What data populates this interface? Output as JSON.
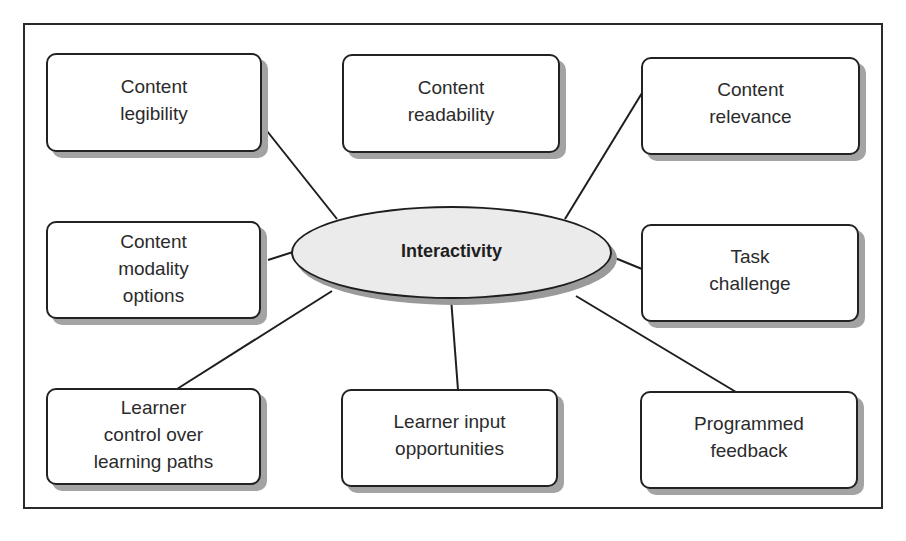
{
  "diagram": {
    "type": "hub-and-spoke concept map",
    "center": {
      "id": "interactivity",
      "label": "Interactivity"
    },
    "nodes": [
      {
        "id": "content-legibility",
        "label": "Content\nlegibility",
        "position": "top-left"
      },
      {
        "id": "content-readability",
        "label": "Content\nreadability",
        "position": "top-center"
      },
      {
        "id": "content-relevance",
        "label": "Content\nrelevance",
        "position": "top-right"
      },
      {
        "id": "content-modality-options",
        "label": "Content\nmodality\noptions",
        "position": "middle-left"
      },
      {
        "id": "task-challenge",
        "label": "Task\nchallenge",
        "position": "middle-right"
      },
      {
        "id": "learner-control",
        "label": "Learner\ncontrol over\nlearning paths",
        "position": "bottom-left"
      },
      {
        "id": "learner-input",
        "label": "Learner input\nopportunities",
        "position": "bottom-center"
      },
      {
        "id": "programmed-feedback",
        "label": "Programmed\nfeedback",
        "position": "bottom-right"
      }
    ],
    "edges": [
      {
        "from": "interactivity",
        "to": "content-legibility"
      },
      {
        "from": "interactivity",
        "to": "content-relevance"
      },
      {
        "from": "interactivity",
        "to": "content-modality-options"
      },
      {
        "from": "interactivity",
        "to": "task-challenge"
      },
      {
        "from": "interactivity",
        "to": "learner-control"
      },
      {
        "from": "interactivity",
        "to": "learner-input"
      },
      {
        "from": "interactivity",
        "to": "programmed-feedback"
      }
    ],
    "colors": {
      "stroke": "#222222",
      "node_fill": "#ffffff",
      "center_fill": "#ebebeb",
      "shadow": "#a3a3a3"
    }
  }
}
